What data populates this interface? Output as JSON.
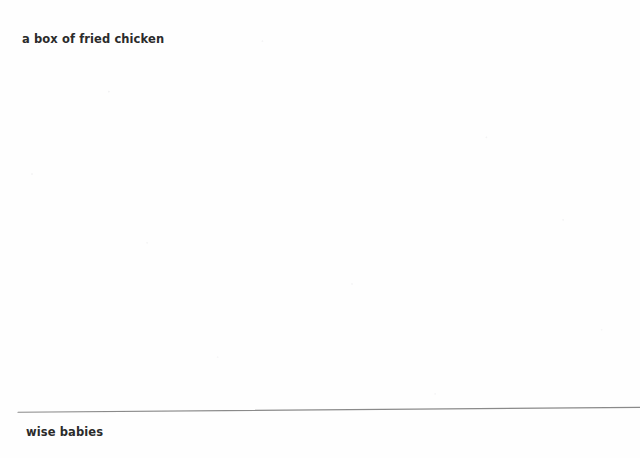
{
  "document": {
    "background_color": "#fefefe",
    "text_color": "#2b2b2b",
    "rule_color": "#8a8a8a",
    "captions": {
      "top": "a box of fried chicken",
      "bottom": "wise babies"
    }
  }
}
